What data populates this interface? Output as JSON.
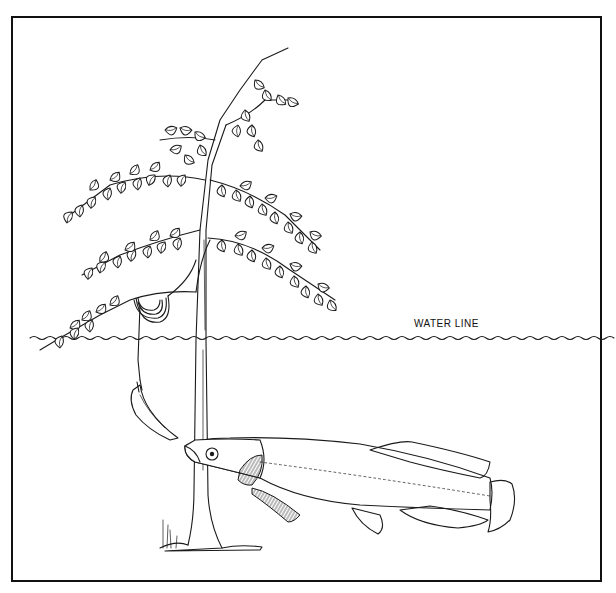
{
  "figure": {
    "labels": {
      "water_line": "WATER LINE"
    },
    "colors": {
      "ink": "#1a1a1a",
      "background": "#ffffff",
      "frame": "#111111"
    }
  }
}
